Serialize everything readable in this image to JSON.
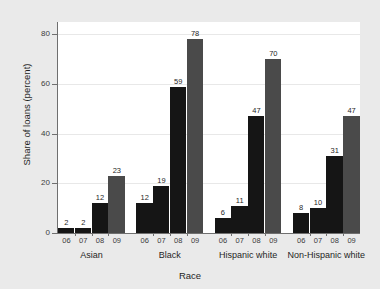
{
  "chart_data": {
    "type": "bar",
    "title": "",
    "subtitle": "",
    "xlabel": "Race",
    "ylabel": "Share of loans (percent)",
    "ylim": [
      0,
      85
    ],
    "yticks": [
      0,
      20,
      40,
      60,
      80
    ],
    "ytick_labels": [
      "0",
      "20",
      "40",
      "60",
      "80"
    ],
    "grid": true,
    "legend": "none",
    "categories": [
      "Asian",
      "Black",
      "Hispanic white",
      "Non-Hispanic white"
    ],
    "subcategories": [
      "06",
      "07",
      "08",
      "09"
    ],
    "series": [
      {
        "name": "06",
        "values": [
          2,
          12,
          6,
          8
        ],
        "color": "#151515"
      },
      {
        "name": "07",
        "values": [
          2,
          19,
          11,
          10
        ],
        "color": "#151515"
      },
      {
        "name": "08",
        "values": [
          12,
          59,
          47,
          31
        ],
        "color": "#151515"
      },
      {
        "name": "09",
        "values": [
          23,
          78,
          70,
          47
        ],
        "color": "#4a4a4a"
      }
    ],
    "bars": [
      {
        "group": "Asian",
        "year": "06",
        "value": 2,
        "label": "2",
        "color": "#151515"
      },
      {
        "group": "Asian",
        "year": "07",
        "value": 2,
        "label": "2",
        "color": "#151515"
      },
      {
        "group": "Asian",
        "year": "08",
        "value": 12,
        "label": "12",
        "color": "#151515"
      },
      {
        "group": "Asian",
        "year": "09",
        "value": 23,
        "label": "23",
        "color": "#4a4a4a"
      },
      {
        "group": "Black",
        "year": "06",
        "value": 12,
        "label": "12",
        "color": "#151515"
      },
      {
        "group": "Black",
        "year": "07",
        "value": 19,
        "label": "19",
        "color": "#151515"
      },
      {
        "group": "Black",
        "year": "08",
        "value": 59,
        "label": "59",
        "color": "#151515"
      },
      {
        "group": "Black",
        "year": "09",
        "value": 78,
        "label": "78",
        "color": "#4a4a4a"
      },
      {
        "group": "Hispanic white",
        "year": "06",
        "value": 6,
        "label": "6",
        "color": "#151515"
      },
      {
        "group": "Hispanic white",
        "year": "07",
        "value": 11,
        "label": "11",
        "color": "#151515"
      },
      {
        "group": "Hispanic white",
        "year": "08",
        "value": 47,
        "label": "47",
        "color": "#151515"
      },
      {
        "group": "Hispanic white",
        "year": "09",
        "value": 70,
        "label": "70",
        "color": "#4a4a4a"
      },
      {
        "group": "Non-Hispanic white",
        "year": "06",
        "value": 8,
        "label": "8",
        "color": "#151515"
      },
      {
        "group": "Non-Hispanic white",
        "year": "07",
        "value": 10,
        "label": "10",
        "color": "#151515"
      },
      {
        "group": "Non-Hispanic white",
        "year": "08",
        "value": 31,
        "label": "31",
        "color": "#151515"
      },
      {
        "group": "Non-Hispanic white",
        "year": "09",
        "value": 47,
        "label": "47",
        "color": "#4a4a4a"
      }
    ]
  },
  "figure": {
    "background_color": "#eaeaea",
    "plot_background_color": "#ffffff",
    "axis_color": "#6f6f6f",
    "gridline_color": "#e8e8e8"
  }
}
